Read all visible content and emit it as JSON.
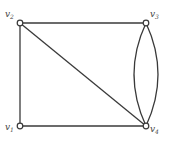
{
  "diagram": {
    "type": "graph",
    "colors": {
      "edge": "#3a3a3a",
      "vertex_fill": "#ffffff",
      "label": "#444444"
    },
    "vertices": [
      {
        "id": "v1",
        "base": "v",
        "sub": "1",
        "x": 20,
        "y": 126,
        "label_x": 5,
        "label_y": 130
      },
      {
        "id": "v2",
        "base": "v",
        "sub": "2",
        "x": 20,
        "y": 23,
        "label_x": 5,
        "label_y": 17
      },
      {
        "id": "v3",
        "base": "v",
        "sub": "3",
        "x": 146,
        "y": 23,
        "label_x": 150,
        "label_y": 17
      },
      {
        "id": "v4",
        "base": "v",
        "sub": "4",
        "x": 146,
        "y": 126,
        "label_x": 150,
        "label_y": 132
      }
    ],
    "edges": [
      {
        "from": "v2",
        "to": "v3",
        "kind": "straight"
      },
      {
        "from": "v2",
        "to": "v1",
        "kind": "straight"
      },
      {
        "from": "v1",
        "to": "v4",
        "kind": "straight"
      },
      {
        "from": "v2",
        "to": "v4",
        "kind": "straight"
      },
      {
        "from": "v3",
        "to": "v4",
        "kind": "curve-left"
      },
      {
        "from": "v3",
        "to": "v4",
        "kind": "curve-right"
      }
    ]
  }
}
